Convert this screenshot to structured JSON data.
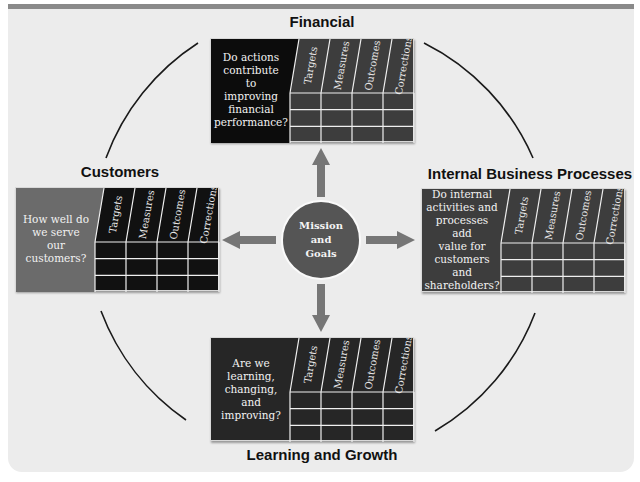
{
  "diagram": {
    "center": {
      "label_lines": [
        "Mission",
        "and",
        "Goals"
      ],
      "fill": "#555555"
    },
    "columns": [
      "Targets",
      "Measures",
      "Outcomes",
      "Corrections"
    ],
    "grid_rows": 3,
    "perspectives": [
      {
        "id": "financial",
        "title": "Financial",
        "question_lines": [
          "Do actions",
          "contribute",
          "to",
          "improving",
          "financial",
          "performance?"
        ],
        "question_fill": "#0c0c0c",
        "grid_fill": "#3d3d3d"
      },
      {
        "id": "customers",
        "title": "Customers",
        "question_lines": [
          "How well do",
          "we serve",
          "our",
          "customers?"
        ],
        "question_fill": "#6b6b6b",
        "grid_fill": "#111111"
      },
      {
        "id": "internal",
        "title": "Internal Business Processes",
        "question_lines": [
          "Do internal",
          "activities and",
          "processes add",
          "value for",
          "customers",
          "and",
          "shareholders?"
        ],
        "question_fill": "#3d3d3d",
        "grid_fill": "#3d3d3d"
      },
      {
        "id": "learning",
        "title": "Learning and Growth",
        "question_lines": [
          "Are we",
          "learning,",
          "changing,",
          "and",
          "improving?"
        ],
        "question_fill": "#262626",
        "grid_fill": "#262626"
      }
    ],
    "colors": {
      "panel": "#ececec",
      "panel_top_bar": "#8a8a8a",
      "arrow": "#767676",
      "arc": "#1a1a1a",
      "grid_line": "#f0f0f0"
    }
  }
}
